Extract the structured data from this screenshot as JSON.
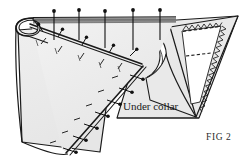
{
  "figure": {
    "caption": "FIG 2",
    "callout": "Under collar",
    "colors": {
      "fabric_fill": "#ececec",
      "fabric_fill_light": "#f4f4f4",
      "fabric_fill_shadow": "#dcdcdc",
      "inner_white": "#ffffff",
      "outline": "#1a1a1a",
      "fold_band": "#8c8c8c",
      "pin_color": "#111111",
      "text_color": "#1a1a1a"
    }
  },
  "pins": {
    "top_row_count": 5,
    "upper_fold_row_count": 6,
    "diagonal_row_count": 9,
    "head_radius": 1.9,
    "shaft_width": 1.1
  },
  "collar_point": {
    "dashed_seam_count": 2,
    "zigzag_edge": "serrated",
    "inner_shape": "trapezoid"
  },
  "labels": {
    "caption": "FIG 2",
    "callout": "Under collar"
  }
}
